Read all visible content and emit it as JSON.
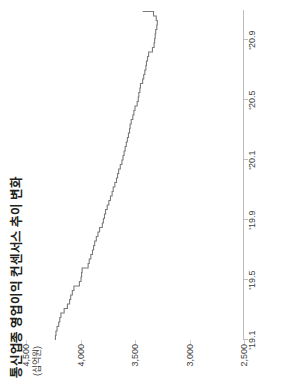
{
  "figure": {
    "title": "통신업종 영업이익 컨센서스 추이 변화",
    "unit_label": "(십억원)",
    "line_color": "#7a7a7a",
    "axis_color": "#bdbdbd"
  },
  "chart_data": {
    "type": "line",
    "title": "통신업종 영업이익 컨센서스 추이 변화",
    "xlabel": "",
    "ylabel": "(십억원)",
    "ylim": [
      2500,
      4500
    ],
    "yticks": [
      2500,
      3000,
      3500,
      4000,
      4500
    ],
    "ytick_labels": [
      "2,500",
      "3,000",
      "3,500",
      "4,000",
      "4,500"
    ],
    "xtick_labels": [
      "'19.1",
      "'19.5",
      "'19.9",
      "'20.1",
      "'20.5",
      "'20.9"
    ],
    "xtick_positions": [
      0,
      4,
      8,
      12,
      16,
      20
    ],
    "xlim": [
      0,
      22
    ],
    "grid": false,
    "legend": null,
    "series": [
      {
        "name": "통신업종 영업이익 컨센서스",
        "x": [
          0,
          0.3,
          0.6,
          0.9,
          1.2,
          1.5,
          1.8,
          2.1,
          2.4,
          2.7,
          3.0,
          3.3,
          3.6,
          3.9,
          4.2,
          4.5,
          4.8,
          5.1,
          5.4,
          5.7,
          6.0,
          6.3,
          6.6,
          6.9,
          7.2,
          7.5,
          7.8,
          8.1,
          8.4,
          8.7,
          9.0,
          9.3,
          9.6,
          9.9,
          10.2,
          10.5,
          10.8,
          11.1,
          11.4,
          11.7,
          12.0,
          12.3,
          12.6,
          12.9,
          13.2,
          13.5,
          13.8,
          14.1,
          14.4,
          14.7,
          15.0,
          15.3,
          15.6,
          15.9,
          16.2,
          16.5,
          16.8,
          17.1,
          17.4,
          17.7,
          18.0,
          18.3,
          18.6,
          18.9,
          19.2,
          19.5,
          19.8,
          20.1,
          20.4,
          20.7,
          21.0,
          21.3,
          21.6,
          21.9
        ],
        "y": [
          4230,
          4225,
          4215,
          4200,
          4190,
          4180,
          4150,
          4120,
          4100,
          4090,
          4075,
          4060,
          4010,
          3995,
          3990,
          3985,
          3930,
          3920,
          3905,
          3890,
          3880,
          3870,
          3855,
          3840,
          3825,
          3800,
          3790,
          3780,
          3770,
          3755,
          3740,
          3725,
          3710,
          3700,
          3685,
          3670,
          3660,
          3650,
          3635,
          3620,
          3610,
          3600,
          3590,
          3580,
          3570,
          3560,
          3550,
          3545,
          3535,
          3520,
          3510,
          3500,
          3480,
          3470,
          3465,
          3455,
          3450,
          3430,
          3420,
          3410,
          3400,
          3395,
          3385,
          3375,
          3340,
          3325,
          3320,
          3315,
          3310,
          3300,
          3295,
          3305,
          3330,
          3430
        ]
      }
    ]
  }
}
